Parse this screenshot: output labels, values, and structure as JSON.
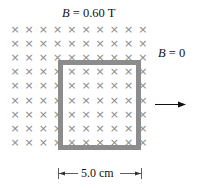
{
  "diagram": {
    "field_label_symbol": "B",
    "field_label_value": " = 0.60 T",
    "outside_label_symbol": "B",
    "outside_label_value": " = 0",
    "dimension_label": "5.0 cm",
    "field_direction_glyph": "×",
    "grid": {
      "columns": 10,
      "rows": 9
    },
    "loop_color": "#8c8c8c",
    "cross_color": "#8a8a8a",
    "velocity_arrow": "right"
  }
}
